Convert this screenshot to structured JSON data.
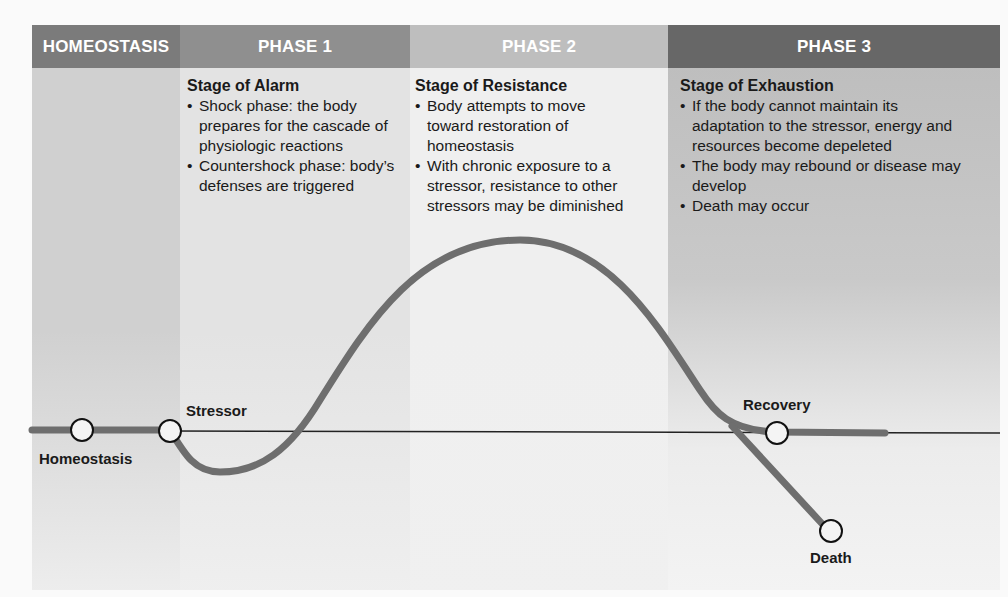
{
  "header": {
    "homeostasis": "HOMEOSTASIS",
    "phase1": "PHASE 1",
    "phase2": "PHASE 2",
    "phase3": "PHASE 3"
  },
  "colors": {
    "homeostasis_header": "#7a7a7a",
    "phase1_header": "#8e8e8e",
    "phase2_header": "#bdbdbd",
    "phase3_header": "#666666",
    "homeostasis_body": "#cfcfcf",
    "phase1_body": "#e2e2e2",
    "phase2_body": "#efefef",
    "phase3_body": "#c4c4c4",
    "curve": "#6e6e6e"
  },
  "stages": {
    "alarm": {
      "title": "Stage of Alarm",
      "bullets": [
        "Shock phase: the body prepares for the cascade of physiologic reactions",
        "Countershock phase: body’s defenses are triggered"
      ]
    },
    "resistance": {
      "title": "Stage of Resistance",
      "bullets": [
        "Body attempts to move toward restoration of homeostasis",
        "With chronic exposure to a stressor, resistance to other stressors may be diminished"
      ]
    },
    "exhaustion": {
      "title": "Stage of Exhaustion",
      "bullets": [
        "If the body cannot maintain its adaptation to the stressor, energy and resources become depeleted",
        "The body may rebound or disease may develop",
        "Death may occur"
      ]
    }
  },
  "labels": {
    "homeostasis": "Homeostasis",
    "stressor": "Stressor",
    "recovery": "Recovery",
    "death": "Death"
  }
}
